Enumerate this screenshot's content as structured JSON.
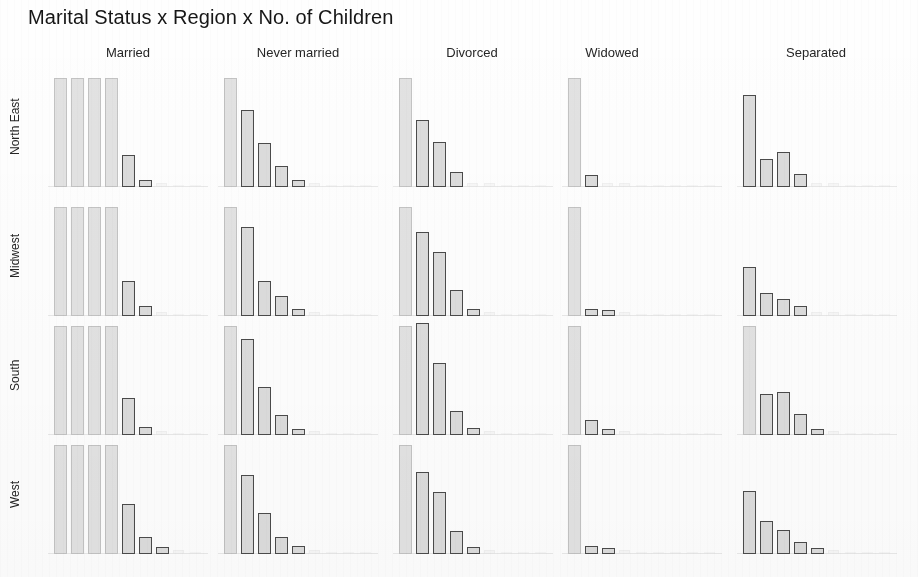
{
  "title": "Marital Status x Region x No. of Children",
  "columns": [
    {
      "label": "Married"
    },
    {
      "label": "Never married"
    },
    {
      "label": "Divorced"
    },
    {
      "label": "Widowed"
    },
    {
      "label": "Separated"
    }
  ],
  "rows": [
    {
      "label": "North East"
    },
    {
      "label": "Midwest"
    },
    {
      "label": "South"
    },
    {
      "label": "West"
    }
  ],
  "chart_data": {
    "type": "bar",
    "title": "Marital Status x Region x No. of Children",
    "xlabel": "No. of Children",
    "ylabel": "Count",
    "grid": false,
    "legend": false,
    "layout": "trellis 4 rows (Region) x 5 columns (Marital Status)",
    "categories": [
      "0",
      "1",
      "2",
      "3",
      "4",
      "5",
      "6",
      "7",
      "8"
    ],
    "note": "Faded scan: in the Married column the first four category bars are washed out to near-white and clipped at full panel height.",
    "panels": [
      {
        "row": "North East",
        "column": "Married",
        "values": [
          100,
          100,
          100,
          100,
          29,
          6,
          1,
          0,
          0
        ],
        "render": [
          "ghost",
          "ghost",
          "ghost",
          "ghost",
          "solid",
          "solid",
          "vanish",
          "vanish",
          "vanish"
        ]
      },
      {
        "row": "North East",
        "column": "Never married",
        "values": [
          100,
          71,
          40,
          19,
          6,
          1,
          0,
          0,
          0
        ],
        "render": [
          "ghost",
          "solid",
          "solid",
          "solid",
          "solid",
          "vanish",
          "vanish",
          "vanish",
          "vanish"
        ]
      },
      {
        "row": "North East",
        "column": "Divorced",
        "values": [
          100,
          61,
          41,
          14,
          3,
          1,
          0,
          0,
          0
        ],
        "render": [
          "ghost",
          "solid",
          "solid",
          "solid",
          "vanish",
          "vanish",
          "vanish",
          "vanish",
          "vanish"
        ]
      },
      {
        "row": "North East",
        "column": "Widowed",
        "values": [
          100,
          11,
          2,
          1,
          0,
          0,
          0,
          0,
          0
        ],
        "render": [
          "ghost",
          "solid",
          "vanish",
          "vanish",
          "vanish",
          "vanish",
          "vanish",
          "vanish",
          "vanish"
        ]
      },
      {
        "row": "North East",
        "column": "Separated",
        "values": [
          84,
          26,
          32,
          12,
          2,
          1,
          0,
          0,
          0
        ],
        "render": [
          "solid",
          "solid",
          "solid",
          "solid",
          "vanish",
          "vanish",
          "vanish",
          "vanish",
          "vanish"
        ]
      },
      {
        "row": "Midwest",
        "column": "Married",
        "values": [
          100,
          100,
          100,
          100,
          32,
          9,
          2,
          0,
          0
        ],
        "render": [
          "ghost",
          "ghost",
          "ghost",
          "ghost",
          "solid",
          "solid",
          "vanish",
          "vanish",
          "vanish"
        ]
      },
      {
        "row": "Midwest",
        "column": "Never married",
        "values": [
          100,
          82,
          32,
          18,
          6,
          1,
          0,
          0,
          0
        ],
        "render": [
          "ghost",
          "solid",
          "solid",
          "solid",
          "solid",
          "vanish",
          "vanish",
          "vanish",
          "vanish"
        ]
      },
      {
        "row": "Midwest",
        "column": "Divorced",
        "values": [
          100,
          77,
          59,
          24,
          6,
          1,
          0,
          0,
          0
        ],
        "render": [
          "ghost",
          "solid",
          "solid",
          "solid",
          "solid",
          "vanish",
          "vanish",
          "vanish",
          "vanish"
        ]
      },
      {
        "row": "Midwest",
        "column": "Widowed",
        "values": [
          100,
          6,
          5,
          1,
          0,
          0,
          0,
          0,
          0
        ],
        "render": [
          "ghost",
          "solid",
          "solid",
          "vanish",
          "vanish",
          "vanish",
          "vanish",
          "vanish",
          "vanish"
        ]
      },
      {
        "row": "Midwest",
        "column": "Separated",
        "values": [
          45,
          21,
          16,
          9,
          1,
          1,
          0,
          0,
          0
        ],
        "render": [
          "solid",
          "solid",
          "solid",
          "solid",
          "vanish",
          "vanish",
          "vanish",
          "vanish",
          "vanish"
        ]
      },
      {
        "row": "South",
        "column": "Married",
        "values": [
          100,
          100,
          100,
          100,
          34,
          7,
          1,
          0,
          0
        ],
        "render": [
          "ghost",
          "ghost",
          "ghost",
          "ghost",
          "solid",
          "solid",
          "vanish",
          "vanish",
          "vanish"
        ]
      },
      {
        "row": "South",
        "column": "Never married",
        "values": [
          100,
          88,
          44,
          18,
          5,
          1,
          0,
          0,
          0
        ],
        "render": [
          "ghost",
          "solid",
          "solid",
          "solid",
          "solid",
          "vanish",
          "vanish",
          "vanish",
          "vanish"
        ]
      },
      {
        "row": "South",
        "column": "Divorced",
        "values": [
          100,
          103,
          66,
          22,
          6,
          1,
          0,
          0,
          0
        ],
        "render": [
          "ghost",
          "solid",
          "solid",
          "solid",
          "solid",
          "vanish",
          "vanish",
          "vanish",
          "vanish"
        ]
      },
      {
        "row": "South",
        "column": "Widowed",
        "values": [
          100,
          14,
          5,
          2,
          0,
          0,
          0,
          0,
          0
        ],
        "render": [
          "ghost",
          "solid",
          "solid",
          "vanish",
          "vanish",
          "vanish",
          "vanish",
          "vanish",
          "vanish"
        ]
      },
      {
        "row": "South",
        "column": "Separated",
        "values": [
          100,
          38,
          39,
          19,
          5,
          1,
          0,
          0,
          0
        ],
        "render": [
          "ghost",
          "solid",
          "solid",
          "solid",
          "solid",
          "vanish",
          "vanish",
          "vanish",
          "vanish"
        ]
      },
      {
        "row": "West",
        "column": "Married",
        "values": [
          100,
          100,
          100,
          100,
          46,
          16,
          6,
          1,
          0
        ],
        "render": [
          "ghost",
          "ghost",
          "ghost",
          "ghost",
          "solid",
          "solid",
          "solid",
          "vanish",
          "vanish"
        ]
      },
      {
        "row": "West",
        "column": "Never married",
        "values": [
          100,
          72,
          38,
          16,
          7,
          1,
          0,
          0,
          0
        ],
        "render": [
          "ghost",
          "solid",
          "solid",
          "solid",
          "solid",
          "vanish",
          "vanish",
          "vanish",
          "vanish"
        ]
      },
      {
        "row": "West",
        "column": "Divorced",
        "values": [
          100,
          75,
          57,
          21,
          6,
          1,
          0,
          0,
          0
        ],
        "render": [
          "ghost",
          "solid",
          "solid",
          "solid",
          "solid",
          "vanish",
          "vanish",
          "vanish",
          "vanish"
        ]
      },
      {
        "row": "West",
        "column": "Widowed",
        "values": [
          100,
          7,
          5,
          1,
          0,
          0,
          0,
          0,
          0
        ],
        "render": [
          "ghost",
          "solid",
          "solid",
          "vanish",
          "vanish",
          "vanish",
          "vanish",
          "vanish",
          "vanish"
        ]
      },
      {
        "row": "West",
        "column": "Separated",
        "values": [
          58,
          30,
          22,
          11,
          5,
          1,
          0,
          0,
          0
        ],
        "render": [
          "solid",
          "solid",
          "solid",
          "solid",
          "solid",
          "vanish",
          "vanish",
          "vanish",
          "vanish"
        ]
      }
    ]
  },
  "geometry": {
    "column_x": [
      48,
      218,
      393,
      562,
      737
    ],
    "column_width": 160,
    "column_header_center": [
      128,
      298,
      472,
      612,
      816
    ],
    "row_y": [
      67,
      196,
      315,
      434
    ],
    "row_height": 120,
    "bar_slot_width": 17,
    "bar_width": 13
  },
  "colors": {
    "bar_fill": "#dcdcdc",
    "bar_stroke": "#4b4b4b",
    "ghost_fill": "#e2e2e2",
    "ghost_stroke": "#c3c3c3",
    "background": "#fefefe",
    "text": "#1a1a1a"
  }
}
